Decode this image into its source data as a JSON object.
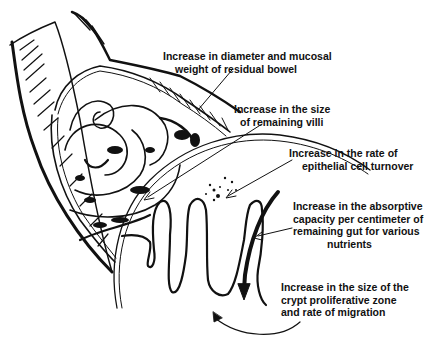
{
  "figure": {
    "type": "anatomical-illustration",
    "colors": {
      "ink": "#111111",
      "background": "#ffffff"
    }
  },
  "labels": [
    {
      "id": "diameter",
      "lines": [
        "Increase in diameter and mucosal",
        "weight of residual bowel"
      ]
    },
    {
      "id": "villi",
      "lines": [
        "Increase in the size",
        "of remaining villi"
      ]
    },
    {
      "id": "turnover",
      "lines": [
        "Increase in the rate of",
        "epithelial cell turnover"
      ]
    },
    {
      "id": "absorptive",
      "lines": [
        "Increase in the absorptive",
        "capacity per centimeter of",
        "remaining gut for various",
        "nutrients"
      ]
    },
    {
      "id": "crypt",
      "lines": [
        "Increase in the size of the",
        "crypt proliferative zone",
        "and rate of migration"
      ]
    }
  ]
}
